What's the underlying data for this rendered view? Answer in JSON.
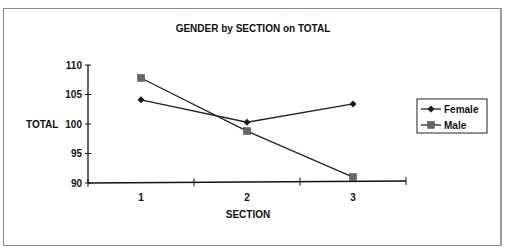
{
  "chart_data": {
    "type": "line",
    "title": "GENDER by SECTION on TOTAL",
    "xlabel": "SECTION",
    "ylabel": "TOTAL",
    "categories": [
      "1",
      "2",
      "3"
    ],
    "ylim": [
      90,
      110
    ],
    "yticks": [
      "90",
      "95",
      "100",
      "105",
      "110"
    ],
    "series": [
      {
        "name": "Female",
        "marker": "diamond",
        "values": [
          104.1,
          100.3,
          103.4
        ]
      },
      {
        "name": "Male",
        "marker": "square",
        "values": [
          107.8,
          98.8,
          91.0
        ]
      }
    ],
    "legend": {
      "position": "right",
      "entries": [
        "Female",
        "Male"
      ]
    },
    "grid": false,
    "colors": {
      "female_marker": "#1a1a1a",
      "male_marker": "#666666",
      "line": "#222222"
    }
  }
}
